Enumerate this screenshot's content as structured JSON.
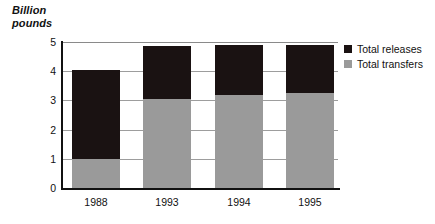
{
  "chart_data": {
    "type": "bar",
    "subtype": "stacked-vertical-bar",
    "title": "",
    "subtitle": "",
    "xlabel": "",
    "ylabel": "Billion\npounds",
    "ylabel_lines": [
      "Billion",
      "pounds"
    ],
    "categories": [
      "1988",
      "1993",
      "1994",
      "1995"
    ],
    "series": [
      {
        "name": "Total transfers",
        "color": "#9a9a9a",
        "values": [
          1.0,
          3.05,
          3.2,
          3.25
        ]
      },
      {
        "name": "Total releases",
        "color": "#1a1212",
        "values": [
          3.05,
          1.8,
          1.7,
          1.65
        ]
      }
    ],
    "totals": [
      4.05,
      4.85,
      4.9,
      4.9
    ],
    "ylim": [
      0,
      5
    ],
    "yticks": [
      0,
      1,
      2,
      3,
      4,
      5
    ],
    "ytick_labels": [
      "0",
      "1",
      "2",
      "3",
      "4",
      "5"
    ],
    "grid": true,
    "grid_axis": "y",
    "legend_position": "right-top",
    "legend_order": [
      "Total releases",
      "Total transfers"
    ],
    "stack_order_bottom_to_top": [
      "Total transfers",
      "Total releases"
    ],
    "units": "Billion pounds"
  },
  "axis": {
    "caption": "Billion\npounds"
  },
  "legend": {
    "items": [
      {
        "label": "Total releases",
        "color": "#1a1212",
        "swatch": "legend-swatch-black"
      },
      {
        "label": "Total transfers",
        "color": "#9a9a9a",
        "swatch": "legend-swatch-gray"
      }
    ]
  },
  "colors": {
    "releases": "#1a1212",
    "transfers": "#9a9a9a",
    "axis": "#111111",
    "gridline": "#9d9d9d",
    "background": "#ffffff"
  }
}
